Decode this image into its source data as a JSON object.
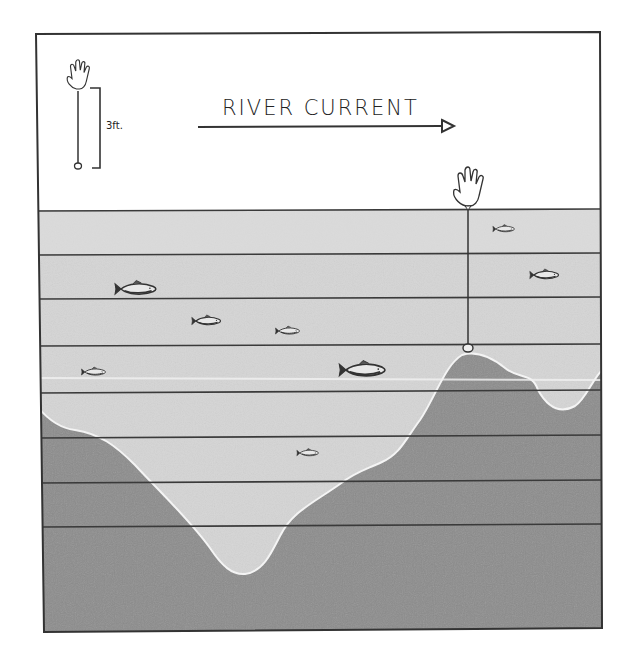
{
  "diagram": {
    "title": "RIVER CURRENT",
    "current_direction": "right",
    "legend": {
      "scale_label": "3ft.",
      "icon": "bobber-hand-float-icon",
      "description": "float with line length bracket"
    },
    "colors": {
      "background": "#ffffff",
      "border": "#333333",
      "water_light": "#d6d6d6",
      "water_mid": "#c9c9c9",
      "riverbed": "#8e8e8e",
      "bottom_outline": "#f2f2f2",
      "depth_lines": "#3a3a3a",
      "fish": "#444444"
    },
    "depth_bands": {
      "count": 8,
      "line_y": [
        210,
        254,
        298,
        345,
        391,
        436,
        481,
        525
      ]
    },
    "float_rig": {
      "x": 468,
      "float_y": 185,
      "weight_y": 348,
      "note": "float line touching the top of the hump"
    },
    "fish": [
      {
        "x": 505,
        "y": 229,
        "size": "small"
      },
      {
        "x": 545,
        "y": 275,
        "size": "medium"
      },
      {
        "x": 135,
        "y": 289,
        "size": "large"
      },
      {
        "x": 207,
        "y": 321,
        "size": "medium"
      },
      {
        "x": 288,
        "y": 331,
        "size": "small"
      },
      {
        "x": 93,
        "y": 372,
        "size": "small"
      },
      {
        "x": 362,
        "y": 370,
        "size": "large"
      },
      {
        "x": 308,
        "y": 453,
        "size": "small"
      }
    ]
  }
}
